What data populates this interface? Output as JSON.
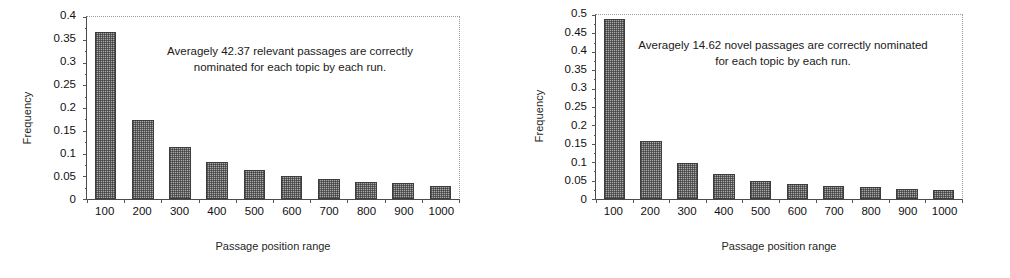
{
  "figure": {
    "background_color": "#ffffff",
    "panel_count": 2
  },
  "chart_data": [
    {
      "type": "bar",
      "title": "",
      "panel": "left",
      "xlabel": "Passage position range",
      "ylabel": "Frequency",
      "categories": [
        "100",
        "200",
        "300",
        "400",
        "500",
        "600",
        "700",
        "800",
        "900",
        "1000"
      ],
      "values": [
        0.362,
        0.172,
        0.113,
        0.081,
        0.063,
        0.051,
        0.044,
        0.037,
        0.034,
        0.029
      ],
      "ylim": [
        0,
        0.4
      ],
      "ytick_labels": [
        "0.4",
        "0.35",
        "0.3",
        "0.25",
        "0.2",
        "0.15",
        "0.1",
        "0.05",
        "0"
      ],
      "ytick_values": [
        0.4,
        0.35,
        0.3,
        0.25,
        0.2,
        0.15,
        0.1,
        0.05,
        0
      ],
      "grid": false,
      "legend": "none",
      "annotation": "Averagely 42.37 relevant passages are correctly nominated for each topic by each run.",
      "bar_fill_color": "#a8a8a8",
      "bar_edge_color": "#3d3d3d"
    },
    {
      "type": "bar",
      "title": "",
      "panel": "right",
      "xlabel": "Passage position range",
      "ylabel": "Frequency",
      "categories": [
        "100",
        "200",
        "300",
        "400",
        "500",
        "600",
        "700",
        "800",
        "900",
        "1000"
      ],
      "values": [
        0.485,
        0.155,
        0.098,
        0.067,
        0.049,
        0.041,
        0.034,
        0.031,
        0.028,
        0.024
      ],
      "ylim": [
        0,
        0.5
      ],
      "ytick_labels": [
        "0.5",
        "0.45",
        "0.4",
        "0.35",
        "0.3",
        "0.25",
        "0.2",
        "0.15",
        "0.1",
        "0.05",
        "0"
      ],
      "ytick_values": [
        0.5,
        0.45,
        0.4,
        0.35,
        0.3,
        0.25,
        0.2,
        0.15,
        0.1,
        0.05,
        0
      ],
      "grid": false,
      "legend": "none",
      "annotation": "Averagely 14.62 novel passages are correctly nominated for each topic by each run.",
      "bar_fill_color": "#a8a8a8",
      "bar_edge_color": "#3d3d3d"
    }
  ]
}
